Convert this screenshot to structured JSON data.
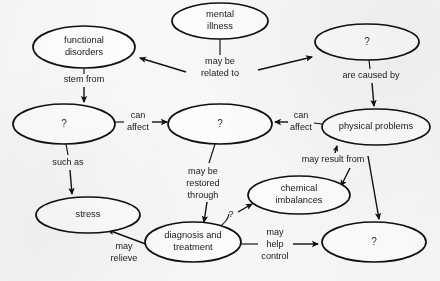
{
  "diagram": {
    "type": "concept-map",
    "background_color": "#f8f8f6",
    "line_color": "#111111",
    "text_color": "#1a1a1a",
    "node_fill": "#fdfdfc",
    "nodes": [
      {
        "id": "functional-disorders",
        "label": "functional\ndisorders",
        "line1": "functional",
        "line2": "disorders",
        "cx": 84,
        "cy": 47,
        "rx": 51,
        "ry": 21
      },
      {
        "id": "mental-illness",
        "label": "mental\nillness",
        "line1": "mental",
        "line2": "illness",
        "cx": 220,
        "cy": 21,
        "rx": 48,
        "ry": 18
      },
      {
        "id": "unknown-top-right",
        "label": "?",
        "cx": 367,
        "cy": 42,
        "rx": 52,
        "ry": 18
      },
      {
        "id": "unknown-left-middle",
        "label": "?",
        "cx": 64,
        "cy": 124,
        "rx": 51,
        "ry": 20
      },
      {
        "id": "unknown-center",
        "label": "?",
        "cx": 220,
        "cy": 124,
        "rx": 52,
        "ry": 20
      },
      {
        "id": "physical-problems",
        "label": "physical problems",
        "cx": 376,
        "cy": 127,
        "rx": 54,
        "ry": 18
      },
      {
        "id": "stress",
        "label": "stress",
        "cx": 88,
        "cy": 215,
        "rx": 52,
        "ry": 18
      },
      {
        "id": "chemical-imbalances",
        "label": "chemical\nimbalances",
        "line1": "chemical",
        "line2": "imbalances",
        "cx": 299,
        "cy": 195,
        "rx": 51,
        "ry": 19
      },
      {
        "id": "diagnosis-and-treatment",
        "label": "diagnosis and\ntreatment",
        "line1": "diagnosis and",
        "line2": "treatment",
        "cx": 193,
        "cy": 242,
        "rx": 48,
        "ry": 20
      },
      {
        "id": "unknown-bottom-right",
        "label": "?",
        "cx": 374,
        "cy": 242,
        "rx": 52,
        "ry": 20
      }
    ],
    "links": [
      {
        "id": "mental-illness-to-functional-disorders",
        "label": "may be\nrelated to",
        "line1": "may be",
        "line2": "related to",
        "from": "mental-illness",
        "to": "functional-disorders",
        "label_x": 220,
        "label_y": 65
      },
      {
        "id": "mental-illness-to-unknown-top-right",
        "label": "may be\nrelated to",
        "from": "mental-illness",
        "to": "unknown-top-right"
      },
      {
        "id": "unknown-top-right-to-physical-problems",
        "label": "are caused by",
        "from": "unknown-top-right",
        "to": "physical-problems",
        "label_x": 371,
        "label_y": 76
      },
      {
        "id": "functional-disorders-to-unknown-left-middle",
        "label": "stem from",
        "from": "functional-disorders",
        "to": "unknown-left-middle",
        "label_x": 84,
        "label_y": 80
      },
      {
        "id": "unknown-left-middle-to-unknown-center",
        "label": "can\naffect",
        "line1": "can",
        "line2": "affect",
        "from": "unknown-left-middle",
        "to": "unknown-center",
        "label_x": 139,
        "label_y": 122
      },
      {
        "id": "physical-problems-to-unknown-center",
        "label": "can\naffect",
        "line1": "can",
        "line2": "affect",
        "from": "physical-problems",
        "to": "unknown-center",
        "label_x": 301,
        "label_y": 122
      },
      {
        "id": "unknown-left-middle-to-stress",
        "label": "such as",
        "from": "unknown-left-middle",
        "to": "stress",
        "label_x": 68,
        "label_y": 163
      },
      {
        "id": "unknown-center-to-diagnosis",
        "label": "may be\nrestored\nthrough",
        "line1": "may be",
        "line2": "restored",
        "line3": "through",
        "from": "unknown-center",
        "to": "diagnosis-and-treatment",
        "label_x": 203,
        "label_y": 186
      },
      {
        "id": "may-result-from",
        "label": "may result from",
        "from": "chemical-imbalances",
        "to": "physical-problems",
        "label_x": 333,
        "label_y": 160
      },
      {
        "id": "diagnosis-to-stress",
        "label": "may\nrelieve",
        "line1": "may",
        "line2": "relieve",
        "from": "diagnosis-and-treatment",
        "to": "stress",
        "label_x": 124,
        "label_y": 250
      },
      {
        "id": "diagnosis-to-unknown-bottom-right",
        "label": "may\nhelp\ncontrol",
        "line1": "may",
        "line2": "help",
        "line3": "control",
        "from": "diagnosis-and-treatment",
        "to": "unknown-bottom-right",
        "label_x": 275,
        "label_y": 245
      },
      {
        "id": "diagnosis-to-chemical-imbalances",
        "label": "?",
        "from": "diagnosis-and-treatment",
        "to": "chemical-imbalances",
        "label_x": 231,
        "label_y": 216
      }
    ]
  }
}
